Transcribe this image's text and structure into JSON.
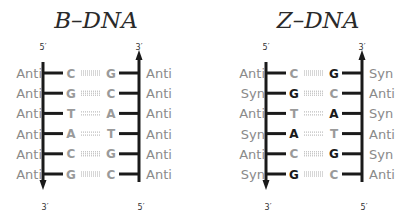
{
  "colors": {
    "strand": "#1a1a1a",
    "base_dark": "#1a1a1a",
    "base_light": "#9a9a9a",
    "bond": "#9a9a9a",
    "conformation_text": "#8a8a8a"
  },
  "panels": [
    {
      "id": "b-dna",
      "title": "B–DNA",
      "left_strand": {
        "top_label": "5′",
        "bottom_label": "3′",
        "arrow": "down"
      },
      "right_strand": {
        "top_label": "3′",
        "bottom_label": "5′",
        "arrow": "up"
      },
      "pairs": [
        {
          "left_conf": "Anti",
          "left_base": "C",
          "left_shade": "light",
          "right_base": "G",
          "right_shade": "light",
          "right_conf": "Anti",
          "bond": "triple"
        },
        {
          "left_conf": "Anti",
          "left_base": "G",
          "left_shade": "light",
          "right_base": "C",
          "right_shade": "light",
          "right_conf": "Anti",
          "bond": "triple"
        },
        {
          "left_conf": "Anti",
          "left_base": "T",
          "left_shade": "light",
          "right_base": "A",
          "right_shade": "light",
          "right_conf": "Anti",
          "bond": "double"
        },
        {
          "left_conf": "Anti",
          "left_base": "A",
          "left_shade": "light",
          "right_base": "T",
          "right_shade": "light",
          "right_conf": "Anti",
          "bond": "double"
        },
        {
          "left_conf": "Anti",
          "left_base": "C",
          "left_shade": "light",
          "right_base": "G",
          "right_shade": "light",
          "right_conf": "Anti",
          "bond": "triple"
        },
        {
          "left_conf": "Anti",
          "left_base": "G",
          "left_shade": "light",
          "right_base": "C",
          "right_shade": "light",
          "right_conf": "Anti",
          "bond": "triple"
        }
      ]
    },
    {
      "id": "z-dna",
      "title": "Z–DNA",
      "left_strand": {
        "top_label": "5′",
        "bottom_label": "3′",
        "arrow": "down"
      },
      "right_strand": {
        "top_label": "3′",
        "bottom_label": "5′",
        "arrow": "up"
      },
      "pairs": [
        {
          "left_conf": "Anti",
          "left_base": "C",
          "left_shade": "light",
          "right_base": "G",
          "right_shade": "dark",
          "right_conf": "Syn",
          "bond": "triple"
        },
        {
          "left_conf": "Syn",
          "left_base": "G",
          "left_shade": "dark",
          "right_base": "C",
          "right_shade": "light",
          "right_conf": "Anti",
          "bond": "triple"
        },
        {
          "left_conf": "Anti",
          "left_base": "T",
          "left_shade": "light",
          "right_base": "A",
          "right_shade": "dark",
          "right_conf": "Syn",
          "bond": "double"
        },
        {
          "left_conf": "Syn",
          "left_base": "A",
          "left_shade": "dark",
          "right_base": "T",
          "right_shade": "light",
          "right_conf": "Anti",
          "bond": "double"
        },
        {
          "left_conf": "Anti",
          "left_base": "C",
          "left_shade": "light",
          "right_base": "G",
          "right_shade": "dark",
          "right_conf": "Syn",
          "bond": "triple"
        },
        {
          "left_conf": "Syn",
          "left_base": "G",
          "left_shade": "dark",
          "right_base": "C",
          "right_shade": "light",
          "right_conf": "Anti",
          "bond": "triple"
        }
      ]
    }
  ]
}
